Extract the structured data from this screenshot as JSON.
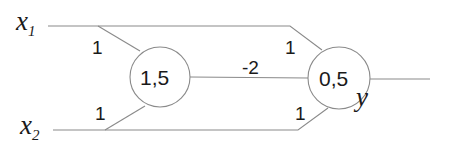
{
  "inputs": [
    {
      "name": "x",
      "subscript": "1"
    },
    {
      "name": "x",
      "subscript": "2"
    }
  ],
  "output": {
    "name": "y"
  },
  "nodes": [
    {
      "id": "hidden",
      "threshold": "1,5"
    },
    {
      "id": "output",
      "threshold": "0,5"
    }
  ],
  "weights": {
    "x1_to_hidden": "1",
    "x2_to_hidden": "1",
    "hidden_to_output": "-2",
    "x1_to_output": "1",
    "x2_to_output": "1"
  },
  "colors": {
    "line": "#8a8a8a",
    "text": "#1a1a1a",
    "background": "#ffffff"
  }
}
